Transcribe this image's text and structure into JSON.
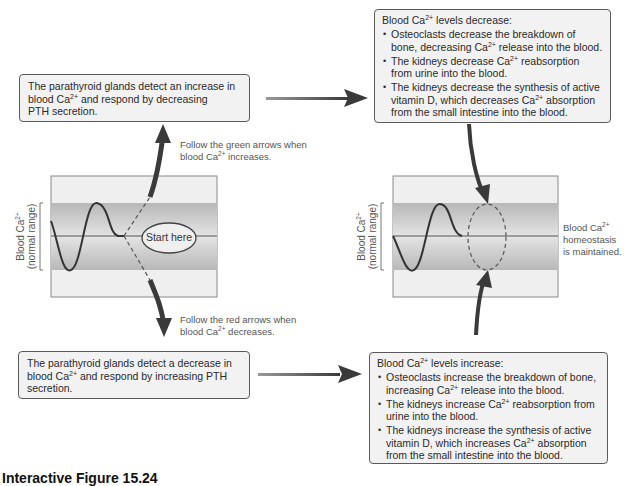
{
  "boxes": {
    "top_left": {
      "line1": "The parathyroid glands detect an increase in",
      "line2a": "blood Ca",
      "line2sup": "2+",
      "line2b": " and respond by decreasing",
      "line3": "PTH secretion."
    },
    "bottom_left": {
      "line1": "The parathyroid glands detect a decrease in",
      "line2a": "blood Ca",
      "line2sup": "2+",
      "line2b": " and respond by increasing PTH",
      "line3": "secretion."
    },
    "top_right": {
      "title_a": "Blood Ca",
      "title_sup": "2+",
      "title_b": " levels decrease:",
      "bullets": [
        {
          "a": "Osteoclasts decrease the breakdown of bone, decreasing Ca",
          "sup": "2+",
          "b": " release into the blood."
        },
        {
          "a": "The kidneys decrease Ca",
          "sup": "2+",
          "b": " reabsorption from urine into the blood."
        },
        {
          "a": "The kidneys decrease the synthesis of active vitamin D, which decreases Ca",
          "sup": "2+",
          "b": " absorption from the small intestine into the blood."
        }
      ]
    },
    "bottom_right": {
      "title_a": "Blood Ca",
      "title_sup": "2+",
      "title_b": " levels increase:",
      "bullets": [
        {
          "a": "Osteoclasts increase the breakdown of bone, increasing Ca",
          "sup": "2+",
          "b": " release into the blood."
        },
        {
          "a": "The kidneys increase Ca",
          "sup": "2+",
          "b": " reabsorption from urine into the blood."
        },
        {
          "a": "The kidneys increase the synthesis of active vitamin D, which increases Ca",
          "sup": "2+",
          "b": " absorption from the small intestine into the blood."
        }
      ]
    }
  },
  "notes": {
    "green": {
      "line1": "Follow the green arrows when",
      "line2a": "blood Ca",
      "line2sup": "2+",
      "line2b": " increases."
    },
    "red": {
      "line1": "Follow the red arrows when",
      "line2a": "blood Ca",
      "line2sup": "2+",
      "line2b": " decreases."
    },
    "homeostasis": {
      "line1a": "Blood Ca",
      "line1sup": "2+",
      "line2": "homeostasis",
      "line3": "is maintained."
    }
  },
  "graphs": {
    "ylabel_a": "Blood Ca",
    "ylabel_sup": "2+",
    "ylabel_line2": "(normal range)",
    "start_label": "Start here"
  },
  "caption": "Interactive Figure 15.24",
  "colors": {
    "box_fill": "#f2f2f2",
    "box_border": "#5a5a5a",
    "arrow": "#3a3a3a",
    "band_dark": "#bdbdbd",
    "band_light": "#ececec"
  }
}
